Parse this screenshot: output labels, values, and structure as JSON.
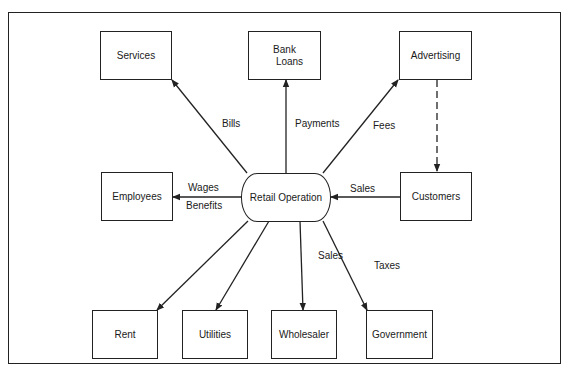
{
  "diagram": {
    "title": "",
    "center": {
      "label": "Retail Operation"
    },
    "nodes": {
      "services": "Services",
      "bank_loans_line1": "Bank",
      "bank_loans_line2": "Loans",
      "advertising": "Advertising",
      "employees": "Employees",
      "customers": "Customers",
      "rent": "Rent",
      "utilities": "Utilities",
      "wholesaler": "Wholesaler",
      "government": "Government"
    },
    "edges": {
      "bills": "Bills",
      "payments": "Payments",
      "fees": "Fees",
      "wages": "Wages",
      "benefits": "Benefits",
      "sales_customers": "Sales",
      "sales_wholesaler": "Sales",
      "taxes": "Taxes"
    },
    "colors": {
      "stroke": "#222222",
      "background": "#ffffff"
    }
  }
}
